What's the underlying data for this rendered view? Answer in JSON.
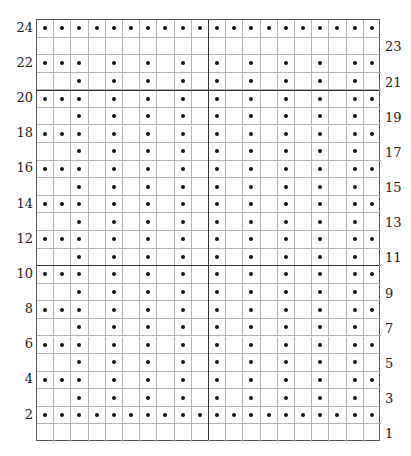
{
  "chart_data": {
    "type": "grid-pattern",
    "title": "",
    "columns": 20,
    "rows": 24,
    "row_numbering": "bottom-to-top",
    "left_labels": [
      "24",
      "22",
      "20",
      "18",
      "16",
      "14",
      "12",
      "10",
      "8",
      "6",
      "4",
      "2"
    ],
    "right_labels": [
      "23",
      "21",
      "19",
      "17",
      "15",
      "13",
      "11",
      "9",
      "7",
      "5",
      "3",
      "1"
    ],
    "thick_horizontal_lines_above_rows": [
      20,
      10
    ],
    "thick_vertical_lines_after_columns": [
      10
    ],
    "symbol": "dot",
    "pattern": {
      "24": [
        1,
        2,
        3,
        4,
        5,
        6,
        7,
        8,
        9,
        10,
        11,
        12,
        13,
        14,
        15,
        16,
        17,
        18,
        19,
        20
      ],
      "23": [],
      "22": [
        1,
        2,
        3,
        5,
        7,
        9,
        11,
        13,
        15,
        17,
        19,
        20
      ],
      "21": [
        3,
        5,
        7,
        9,
        11,
        13,
        15,
        17,
        19
      ],
      "20": [
        1,
        2,
        3,
        5,
        7,
        9,
        11,
        13,
        15,
        17,
        19,
        20
      ],
      "19": [
        3,
        5,
        7,
        9,
        11,
        13,
        15,
        17,
        19
      ],
      "18": [
        1,
        2,
        3,
        5,
        7,
        9,
        11,
        13,
        15,
        17,
        19,
        20
      ],
      "17": [
        3,
        5,
        7,
        9,
        11,
        13,
        15,
        17,
        19
      ],
      "16": [
        1,
        2,
        3,
        5,
        7,
        9,
        11,
        13,
        15,
        17,
        19,
        20
      ],
      "15": [
        3,
        5,
        7,
        9,
        11,
        13,
        15,
        17,
        19
      ],
      "14": [
        1,
        2,
        3,
        5,
        7,
        9,
        11,
        13,
        15,
        17,
        19,
        20
      ],
      "13": [
        3,
        5,
        7,
        9,
        11,
        13,
        15,
        17,
        19
      ],
      "12": [
        1,
        2,
        3,
        5,
        7,
        9,
        11,
        13,
        15,
        17,
        19,
        20
      ],
      "11": [
        3,
        5,
        7,
        9,
        11,
        13,
        15,
        17,
        19
      ],
      "10": [
        1,
        2,
        3,
        5,
        7,
        9,
        11,
        13,
        15,
        17,
        19,
        20
      ],
      "9": [
        3,
        5,
        7,
        9,
        11,
        13,
        15,
        17,
        19
      ],
      "8": [
        1,
        2,
        3,
        5,
        7,
        9,
        11,
        13,
        15,
        17,
        19,
        20
      ],
      "7": [
        3,
        5,
        7,
        9,
        11,
        13,
        15,
        17,
        19
      ],
      "6": [
        1,
        2,
        3,
        5,
        7,
        9,
        11,
        13,
        15,
        17,
        19,
        20
      ],
      "5": [
        3,
        5,
        7,
        9,
        11,
        13,
        15,
        17,
        19
      ],
      "4": [
        1,
        2,
        3,
        5,
        7,
        9,
        11,
        13,
        15,
        17,
        19,
        20
      ],
      "3": [
        3,
        5,
        7,
        9,
        11,
        13,
        15,
        17,
        19
      ],
      "2": [
        1,
        2,
        3,
        4,
        5,
        6,
        7,
        8,
        9,
        10,
        11,
        12,
        13,
        14,
        15,
        16,
        17,
        18,
        19,
        20
      ],
      "1": []
    },
    "colors": {
      "grid_line": "#b4b4b4",
      "thick_line": "#333333",
      "dot": "#111111",
      "background": "#ffffff"
    }
  }
}
